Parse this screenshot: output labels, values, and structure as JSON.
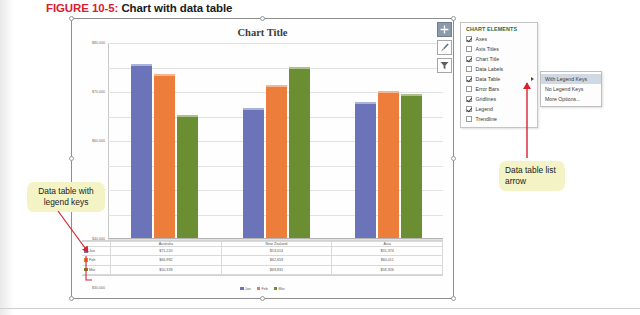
{
  "figure": {
    "label": "FIGURE 10-5:",
    "caption": "Chart with data table"
  },
  "chart": {
    "title": "Chart Title",
    "buttons": [
      {
        "name": "chart-elements-button",
        "icon": "plus-icon",
        "active": true
      },
      {
        "name": "chart-styles-button",
        "icon": "paintbrush-icon",
        "active": false
      },
      {
        "name": "chart-filters-button",
        "icon": "funnel-icon",
        "active": false
      }
    ]
  },
  "chart_data": {
    "type": "bar",
    "title": "Chart Title",
    "xlabel": "",
    "ylabel": "",
    "ylim": [
      0,
      80000
    ],
    "ytick_labels": [
      "$80,000",
      "$70,000",
      "$60,000",
      "$50,000",
      "$40,000",
      "$30,000",
      "$20,000",
      "$10,000",
      "$0"
    ],
    "ytick_values": [
      80000,
      70000,
      60000,
      50000,
      40000,
      30000,
      20000,
      10000,
      0
    ],
    "grid": true,
    "legend_position": "bottom",
    "categories": [
      "Australia",
      "New Zealand",
      "Asia"
    ],
    "series": [
      {
        "name": "Jan",
        "color": "#6b74b8",
        "values": [
          71220,
          53014,
          55374
        ]
      },
      {
        "name": "Feb",
        "color": "#ed7d3a",
        "values": [
          66992,
          62659,
          60011
        ]
      },
      {
        "name": "Mar",
        "color": "#6b8e32",
        "values": [
          50339,
          69831,
          58926
        ]
      }
    ],
    "data_table": {
      "visible": true,
      "with_legend_keys": true,
      "columns": [
        "Australia",
        "New Zealand",
        "Asia"
      ],
      "rows": [
        {
          "key": "Jan",
          "color": "#6b74b8",
          "values": [
            "$71,220",
            "$53,014",
            "$55,374"
          ]
        },
        {
          "key": "Feb",
          "color": "#ed7d3a",
          "values": [
            "$66,992",
            "$62,659",
            "$60,011"
          ]
        },
        {
          "key": "Mar",
          "color": "#6b8e32",
          "values": [
            "$50,339",
            "$69,831",
            "$58,926"
          ]
        }
      ]
    },
    "legend": [
      {
        "name": "Jan",
        "color": "#6b74b8"
      },
      {
        "name": "Feb",
        "color": "#ed7d3a"
      },
      {
        "name": "Mar",
        "color": "#6b8e32"
      }
    ]
  },
  "chart_elements_panel": {
    "title": "CHART ELEMENTS",
    "items": [
      {
        "label": "Axes",
        "checked": true,
        "has_arrow": false
      },
      {
        "label": "Axis Titles",
        "checked": false,
        "has_arrow": false
      },
      {
        "label": "Chart Title",
        "checked": true,
        "has_arrow": false
      },
      {
        "label": "Data Labels",
        "checked": false,
        "has_arrow": false
      },
      {
        "label": "Data Table",
        "checked": true,
        "has_arrow": true
      },
      {
        "label": "Error Bars",
        "checked": false,
        "has_arrow": false
      },
      {
        "label": "Gridlines",
        "checked": true,
        "has_arrow": false
      },
      {
        "label": "Legend",
        "checked": true,
        "has_arrow": false
      },
      {
        "label": "Trendline",
        "checked": false,
        "has_arrow": false
      }
    ]
  },
  "data_table_submenu": {
    "items": [
      {
        "label": "With Legend Keys",
        "highlighted": true
      },
      {
        "label": "No Legend Keys",
        "highlighted": false
      },
      {
        "label": "More Options...",
        "highlighted": false
      }
    ]
  },
  "callouts": {
    "left": "Data table with legend keys",
    "right": "Data table list arrow"
  },
  "colors": {
    "figure_label": "#d8202f",
    "panel_title": "#2e6b3e",
    "callout_bg": "#f3f3c6",
    "arrow": "#d8202f",
    "highlight": "#cfd9e4"
  }
}
